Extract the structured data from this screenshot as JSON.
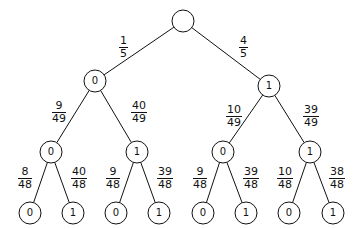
{
  "diagram": {
    "type": "probability-tree",
    "colors": {
      "stroke": "#111111",
      "background": "#ffffff"
    },
    "nodes": [
      {
        "id": "root",
        "label": "",
        "x": 183,
        "y": 21
      },
      {
        "id": "L0",
        "label": "0",
        "x": 95,
        "y": 81
      },
      {
        "id": "L1",
        "label": "1",
        "x": 269,
        "y": 86
      },
      {
        "id": "L00",
        "label": "0",
        "x": 51,
        "y": 152
      },
      {
        "id": "L01",
        "label": "1",
        "x": 137,
        "y": 152
      },
      {
        "id": "L10",
        "label": "0",
        "x": 223,
        "y": 152
      },
      {
        "id": "L11",
        "label": "1",
        "x": 310,
        "y": 152
      },
      {
        "id": "L000",
        "label": "0",
        "x": 30,
        "y": 213
      },
      {
        "id": "L001",
        "label": "1",
        "x": 73,
        "y": 213
      },
      {
        "id": "L010",
        "label": "0",
        "x": 116,
        "y": 213
      },
      {
        "id": "L011",
        "label": "1",
        "x": 159,
        "y": 213
      },
      {
        "id": "L100",
        "label": "0",
        "x": 203,
        "y": 213
      },
      {
        "id": "L101",
        "label": "1",
        "x": 246,
        "y": 213
      },
      {
        "id": "L110",
        "label": "0",
        "x": 289,
        "y": 213
      },
      {
        "id": "L111",
        "label": "1",
        "x": 333,
        "y": 213
      }
    ],
    "edges": [
      {
        "from": "root",
        "to": "L0",
        "num": "1",
        "den": "5",
        "lx": 119,
        "ly": 35
      },
      {
        "from": "root",
        "to": "L1",
        "num": "4",
        "den": "5",
        "lx": 239,
        "ly": 35
      },
      {
        "from": "L0",
        "to": "L00",
        "num": "9",
        "den": "49",
        "lx": 52,
        "ly": 100
      },
      {
        "from": "L0",
        "to": "L01",
        "num": "40",
        "den": "49",
        "lx": 131,
        "ly": 100
      },
      {
        "from": "L1",
        "to": "L10",
        "num": "10",
        "den": "49",
        "lx": 226,
        "ly": 104
      },
      {
        "from": "L1",
        "to": "L11",
        "num": "39",
        "den": "49",
        "lx": 303,
        "ly": 104
      },
      {
        "from": "L00",
        "to": "L000",
        "num": "8",
        "den": "48",
        "lx": 18,
        "ly": 166
      },
      {
        "from": "L00",
        "to": "L001",
        "num": "40",
        "den": "48",
        "lx": 71,
        "ly": 166
      },
      {
        "from": "L01",
        "to": "L010",
        "num": "9",
        "den": "48",
        "lx": 106,
        "ly": 166
      },
      {
        "from": "L01",
        "to": "L011",
        "num": "39",
        "den": "48",
        "lx": 157,
        "ly": 166
      },
      {
        "from": "L10",
        "to": "L100",
        "num": "9",
        "den": "48",
        "lx": 193,
        "ly": 166
      },
      {
        "from": "L10",
        "to": "L101",
        "num": "39",
        "den": "48",
        "lx": 243,
        "ly": 166
      },
      {
        "from": "L11",
        "to": "L110",
        "num": "10",
        "den": "48",
        "lx": 277,
        "ly": 166
      },
      {
        "from": "L11",
        "to": "L111",
        "num": "38",
        "den": "48",
        "lx": 329,
        "ly": 166
      }
    ]
  }
}
